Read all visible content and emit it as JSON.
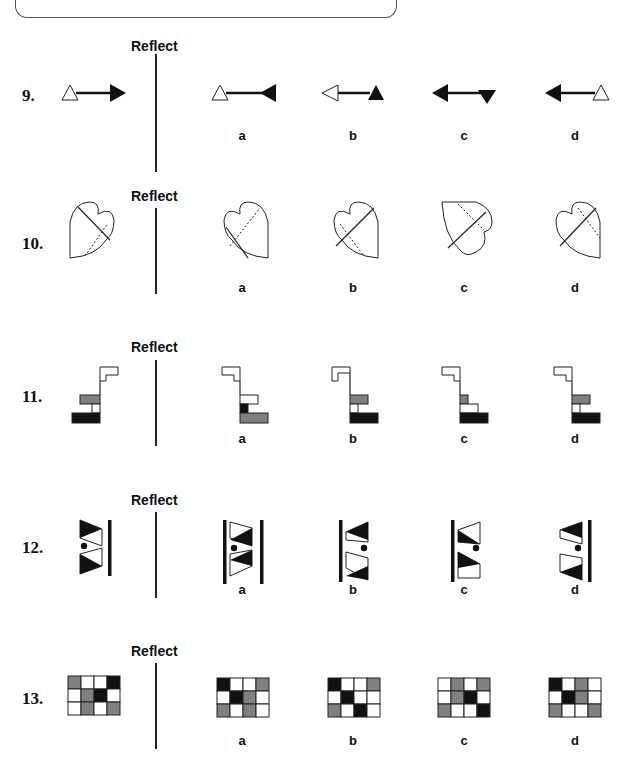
{
  "instruction_box": {
    "visible": true
  },
  "reflect_label": "Reflect",
  "questions": [
    {
      "number": "9.",
      "type": "arrow",
      "prompt": {
        "left_end": "hollow-triangle-up",
        "right_end": "filled-arrowhead-right"
      },
      "options": [
        {
          "label": "a",
          "left_end": "hollow-triangle-up",
          "right_end": "filled-arrowhead-left"
        },
        {
          "label": "b",
          "left_end": "hollow-arrowhead-left",
          "right_end": "filled-triangle-up"
        },
        {
          "label": "c",
          "left_end": "filled-arrowhead-left",
          "right_end": "filled-triangle-down"
        },
        {
          "label": "d",
          "left_end": "filled-arrowhead-left",
          "right_end": "hollow-triangle-up"
        }
      ]
    },
    {
      "number": "10.",
      "type": "heart",
      "prompt": {
        "orientation": "lobes-top-right",
        "solid_line": "diagonal-tl-br",
        "dotted_line": "diagonal-bl-tr"
      },
      "options": [
        {
          "label": "a",
          "orientation": "lobes-top-left"
        },
        {
          "label": "b",
          "orientation": "lobes-top-left"
        },
        {
          "label": "c",
          "orientation": "lobes-right-rotated"
        },
        {
          "label": "d",
          "orientation": "lobes-top-left"
        }
      ]
    },
    {
      "number": "11.",
      "type": "stairs",
      "prompt": {
        "top": "white-hook-right",
        "middle": "gray",
        "lower": "white",
        "bottom": "black"
      },
      "options": [
        {
          "label": "a",
          "middle": "white",
          "lower": "black",
          "bottom": "gray"
        },
        {
          "label": "b",
          "middle": "gray",
          "lower": "white",
          "bottom": "black"
        },
        {
          "label": "c",
          "middle": "gray-small",
          "lower": "white-wide",
          "bottom": "black"
        },
        {
          "label": "d",
          "middle": "gray",
          "lower": "white",
          "bottom": "black"
        }
      ]
    },
    {
      "number": "12.",
      "type": "bowtie",
      "prompt": {
        "bar_side": "right",
        "dot_side": "left"
      },
      "options": [
        {
          "label": "a",
          "bar_side": "both",
          "dot_side": "left"
        },
        {
          "label": "b",
          "bar_side": "left",
          "dot_side": "right"
        },
        {
          "label": "c",
          "bar_side": "left",
          "dot_side": "right"
        },
        {
          "label": "d",
          "bar_side": "right",
          "dot_side": "right"
        }
      ]
    },
    {
      "number": "13.",
      "type": "grid",
      "prompt": {
        "cells": [
          [
            "G",
            "W",
            "W",
            "B"
          ],
          [
            "W",
            "G",
            "B",
            "W"
          ],
          [
            "W",
            "G",
            "W",
            "G"
          ]
        ]
      },
      "options": [
        {
          "label": "a",
          "cells": [
            [
              "B",
              "W",
              "W",
              "G"
            ],
            [
              "W",
              "B",
              "G",
              "W"
            ],
            [
              "G",
              "W",
              "G",
              "W"
            ]
          ]
        },
        {
          "label": "b",
          "cells": [
            [
              "B",
              "W",
              "W",
              "G"
            ],
            [
              "W",
              "B",
              "W",
              "W"
            ],
            [
              "G",
              "W",
              "B",
              "W"
            ]
          ]
        },
        {
          "label": "c",
          "cells": [
            [
              "W",
              "G",
              "W",
              "G"
            ],
            [
              "W",
              "G",
              "B",
              "W"
            ],
            [
              "G",
              "W",
              "W",
              "B"
            ]
          ]
        },
        {
          "label": "d",
          "cells": [
            [
              "B",
              "W",
              "G",
              "W"
            ],
            [
              "W",
              "B",
              "G",
              "W"
            ],
            [
              "G",
              "W",
              "W",
              "G"
            ]
          ]
        }
      ]
    }
  ],
  "colors": {
    "black": "#111111",
    "gray": "#808080",
    "white": "#ffffff",
    "line": "#222222"
  }
}
